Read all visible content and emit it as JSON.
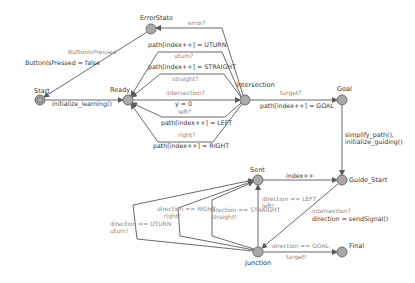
{
  "diagram": {
    "type": "state-machine",
    "colors": {
      "node_fill": "#a9a9a9",
      "node_stroke": "#6e6e6e",
      "edge": "#5a5a5a",
      "guard_text": "#8a8a8a",
      "action_text": "#3a3a3a"
    },
    "states": {
      "start": "Start",
      "error_state": "ErrorState",
      "ready": "Ready",
      "intersection": "Intersection",
      "goal": "Goal",
      "guide_start": "Guide_Start",
      "sent": "Sent",
      "junction": "Junction",
      "final": "Final"
    },
    "transitions": {
      "start_ready": {
        "action": "initialize_learning()"
      },
      "error_start": {
        "guard": "ButtonIsPressed",
        "action": "ButtonIsPressed = false"
      },
      "intersection_error": {
        "guard": "error?"
      },
      "uturn": {
        "guard": "uturn?",
        "action": "path[index++] = UTURN"
      },
      "straight": {
        "guard": "straight?",
        "action": "path[index++] = STRAIGHT"
      },
      "ready_intersection": {
        "guard": "intersection?",
        "action": "y = 0"
      },
      "left": {
        "guard": "left?",
        "action": "path[index++] = LEFT"
      },
      "right": {
        "guard": "right?",
        "action": "path[index++] = RIGHT"
      },
      "intersection_goal": {
        "guard": "target?",
        "action": "path[index++] = GOAL"
      },
      "goal_guide": {
        "action": "simplify_path(),\ninitialize_guiding()"
      },
      "sent_guide": {
        "action": "index++"
      },
      "junction_sent_left": {
        "guard": "direction == LEFT",
        "action": "left!"
      },
      "junction_sent_straight": {
        "guard": "direction == STRAIGHT",
        "action": "straight!"
      },
      "junction_sent_right": {
        "guard": "direction == RIGHT",
        "action": "right!"
      },
      "junction_sent_uturn": {
        "guard": "direction == UTURN",
        "action": "uturn!"
      },
      "guide_junction": {
        "guard": "intersection?",
        "action": "direction = sendSignal()"
      },
      "junction_final": {
        "guard": "direction == GOAL",
        "action": "target!"
      }
    }
  }
}
